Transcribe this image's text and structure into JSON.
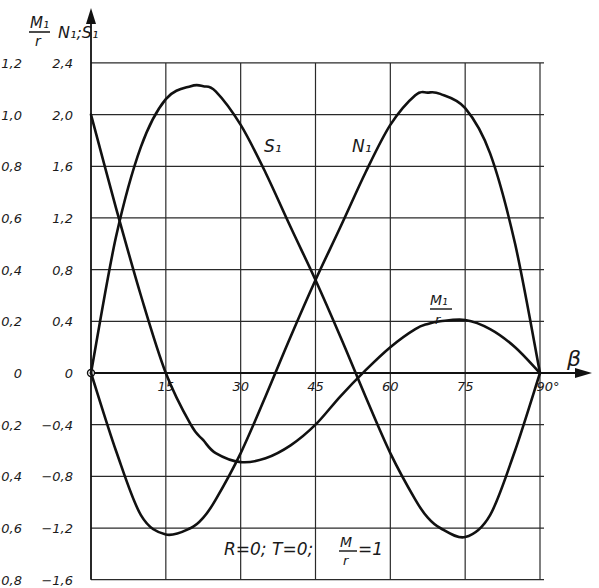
{
  "chart_data": {
    "type": "line",
    "title": "",
    "xlabel": "β",
    "x_unit_suffix": "°",
    "ylabel_left": "M1/r",
    "ylabel_right": "N1; S1",
    "annotation": "R=0; T=0; M/r=1",
    "xlim": [
      0,
      90
    ],
    "ylim_NS": [
      -1.6,
      2.4
    ],
    "ylim_M": [
      -0.8,
      1.2
    ],
    "grid": true,
    "x_ticks": [
      15,
      30,
      45,
      60,
      75,
      90
    ],
    "x_tick_labels": [
      "15",
      "30",
      "45",
      "60",
      "75",
      "90°"
    ],
    "y_ticks_NS": [
      2.4,
      2.0,
      1.6,
      1.2,
      0.8,
      0.4,
      0,
      -0.4,
      -0.8,
      -1.2,
      -1.6
    ],
    "y_tick_labels_NS": [
      "2,4",
      "2,0",
      "1,6",
      "1,2",
      "0,8",
      "0,4",
      "0",
      "-0,4",
      "-0,8",
      "-1,2",
      "-1,6"
    ],
    "y_tick_labels_M": [
      "1,2",
      "1,0",
      "0,8",
      "0,6",
      "0,4",
      "0,2",
      "0",
      "-0,2",
      "-0,4",
      "-0,6",
      "-0,8"
    ],
    "x": [
      0,
      5,
      10,
      15,
      20,
      22.5,
      25,
      30,
      35,
      40,
      45,
      50,
      55,
      60,
      65,
      67.5,
      70,
      75,
      80,
      85,
      90
    ],
    "series": [
      {
        "name": "S1",
        "scale": "N1;S1",
        "label_text": "S₁",
        "values": [
          0,
          1.05,
          1.75,
          2.12,
          2.22,
          2.22,
          2.18,
          1.92,
          1.55,
          1.13,
          0.72,
          0.28,
          -0.18,
          -0.62,
          -0.98,
          -1.12,
          -1.2,
          -1.27,
          -1.1,
          -0.6,
          0
        ]
      },
      {
        "name": "N1",
        "scale": "N1;S1",
        "label_text": "N₁",
        "values": [
          0,
          -0.6,
          -1.1,
          -1.25,
          -1.2,
          -1.12,
          -0.98,
          -0.62,
          -0.18,
          0.28,
          0.72,
          1.13,
          1.55,
          1.92,
          2.15,
          2.17,
          2.16,
          2.05,
          1.7,
          1.0,
          0
        ]
      },
      {
        "name": "M1/r",
        "scale": "M1/r",
        "label_text": "M₁/r",
        "values": [
          1.0,
          0.64,
          0.3,
          0.0,
          -0.2,
          -0.26,
          -0.31,
          -0.345,
          -0.33,
          -0.28,
          -0.2,
          -0.09,
          0.01,
          0.1,
          0.17,
          0.19,
          0.2,
          0.205,
          0.17,
          0.1,
          0
        ]
      }
    ]
  },
  "labels": {
    "m_axis_num": "M₁",
    "m_axis_den": "r",
    "ns_axis": "N₁;S₁",
    "beta": "β",
    "s1": "S₁",
    "n1": "N₁",
    "m1_num": "M₁",
    "m1_den": "r",
    "annot_left": "R=0; T=0;",
    "annot_frac_num": "M",
    "annot_frac_den": "r",
    "annot_right": "=1"
  }
}
